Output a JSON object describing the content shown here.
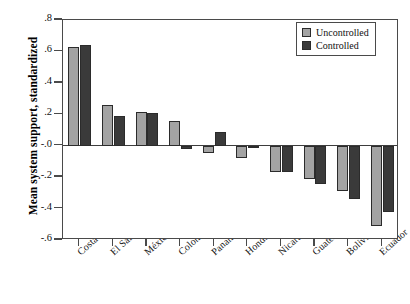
{
  "chart_data": {
    "type": "bar",
    "title": "",
    "subtitle": "",
    "xlabel": "",
    "ylabel": "Mean system support, standardized",
    "ylim": [
      -0.6,
      0.8
    ],
    "yticks": [
      0.8,
      0.6,
      0.4,
      0.2,
      0.0,
      -0.2,
      -0.4,
      -0.6
    ],
    "ytick_labels": [
      ".8",
      ".6",
      ".4",
      ".2",
      "-.0",
      "-.2",
      "-.4",
      "-.6"
    ],
    "grid": false,
    "legend_position": "top-right",
    "zero_line": true,
    "categories": [
      "Costa Rica",
      "El Salvador",
      "México",
      "Colombia",
      "Panamá",
      "Honduras",
      "Nicaragua",
      "Guatemala",
      "Bolivia",
      "Ecuador"
    ],
    "series": [
      {
        "name": "Uncontrolled",
        "color": "#a3a3a3",
        "values": [
          0.63,
          0.26,
          0.215,
          0.16,
          -0.045,
          -0.08,
          -0.17,
          -0.215,
          -0.29,
          -0.51
        ]
      },
      {
        "name": "Controlled",
        "color": "#3a3a3a",
        "values": [
          0.64,
          0.19,
          0.21,
          -0.02,
          0.09,
          -0.015,
          -0.165,
          -0.245,
          -0.34,
          -0.42
        ]
      }
    ]
  },
  "legend": {
    "items": [
      {
        "label": "Uncontrolled",
        "swatch": "unc"
      },
      {
        "label": "Controlled",
        "swatch": "ctl"
      }
    ]
  }
}
